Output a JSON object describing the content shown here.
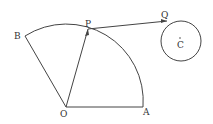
{
  "diagram": {
    "labels": {
      "O": "O",
      "A": "A",
      "B": "B",
      "P": "P",
      "Q": "Q",
      "C": "C"
    },
    "points": {
      "O": [
        66,
        107
      ],
      "A": [
        143,
        107
      ],
      "B": [
        25,
        36
      ],
      "P": [
        88,
        29
      ],
      "Q": [
        167,
        21
      ],
      "C": [
        181,
        40
      ]
    },
    "circle_radius": 20,
    "sector_radius": 77,
    "colors": {
      "stroke": "#444444",
      "label": "#333333"
    }
  }
}
